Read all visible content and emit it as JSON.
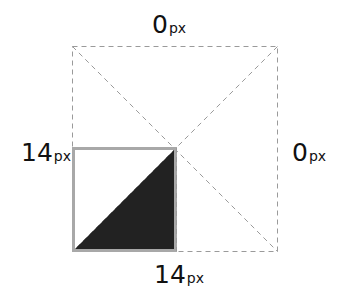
{
  "diagram": {
    "title": "",
    "labels": {
      "top": {
        "value": "0",
        "unit": "px"
      },
      "left": {
        "value": "14",
        "unit": "px"
      },
      "right": {
        "value": "0",
        "unit": "px"
      },
      "bottom": {
        "value": "14",
        "unit": "px"
      }
    },
    "colors": {
      "dashed_line": "#9a9a9a",
      "box_border": "#a8a8a8",
      "triangle_fill": "#222222",
      "text": "#111111"
    }
  }
}
